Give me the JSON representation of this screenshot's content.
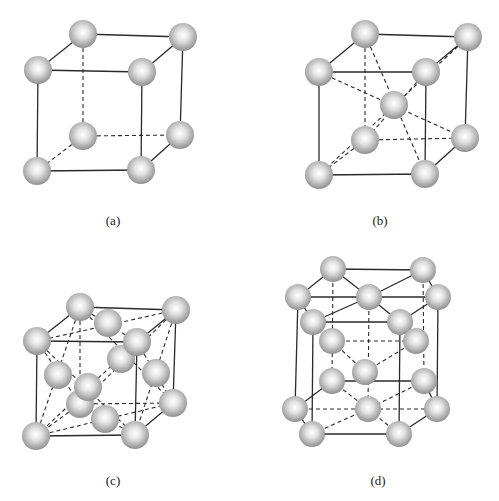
{
  "figure": {
    "sphere_color_center": "#ffffff",
    "sphere_color_edge": "#8a8a8a",
    "line_color": "#2a2a2a",
    "panels": [
      {
        "id": "a",
        "label": "(a)",
        "label_pos": [
          113,
          213
        ],
        "radius": 14,
        "atoms": [
          [
            83,
            136
          ],
          [
            180,
            135
          ],
          [
            83,
            34
          ],
          [
            183,
            37
          ],
          [
            38,
            70
          ],
          [
            142,
            72
          ],
          [
            37,
            171
          ],
          [
            141,
            170
          ]
        ],
        "edges": [
          [
            [
              83,
              34
            ],
            [
              183,
              37
            ],
            "solid"
          ],
          [
            [
              38,
              70
            ],
            [
              142,
              72
            ],
            "solid"
          ],
          [
            [
              83,
              34
            ],
            [
              38,
              70
            ],
            "solid"
          ],
          [
            [
              183,
              37
            ],
            [
              142,
              72
            ],
            "solid"
          ],
          [
            [
              38,
              70
            ],
            [
              37,
              171
            ],
            "solid"
          ],
          [
            [
              142,
              72
            ],
            [
              141,
              170
            ],
            "solid"
          ],
          [
            [
              183,
              37
            ],
            [
              180,
              135
            ],
            "solid"
          ],
          [
            [
              37,
              171
            ],
            [
              141,
              170
            ],
            "solid"
          ],
          [
            [
              180,
              135
            ],
            [
              141,
              170
            ],
            "solid"
          ],
          [
            [
              83,
              34
            ],
            [
              83,
              136
            ],
            "dash"
          ],
          [
            [
              83,
              136
            ],
            [
              180,
              135
            ],
            "dash"
          ],
          [
            [
              83,
              136
            ],
            [
              37,
              171
            ],
            "dash"
          ]
        ]
      },
      {
        "id": "b",
        "label": "(b)",
        "label_pos": [
          380,
          213
        ],
        "radius": 14,
        "atoms": [
          [
            365,
            140
          ],
          [
            465,
            138
          ],
          [
            365,
            34
          ],
          [
            468,
            37
          ],
          [
            319,
            72
          ],
          [
            426,
            72
          ],
          [
            394,
            105
          ],
          [
            319,
            175
          ],
          [
            425,
            174
          ]
        ],
        "edges": [
          [
            [
              365,
              34
            ],
            [
              468,
              37
            ],
            "solid"
          ],
          [
            [
              319,
              72
            ],
            [
              426,
              72
            ],
            "solid"
          ],
          [
            [
              365,
              34
            ],
            [
              319,
              72
            ],
            "solid"
          ],
          [
            [
              468,
              37
            ],
            [
              426,
              72
            ],
            "solid"
          ],
          [
            [
              319,
              72
            ],
            [
              319,
              175
            ],
            "solid"
          ],
          [
            [
              426,
              72
            ],
            [
              425,
              174
            ],
            "solid"
          ],
          [
            [
              468,
              37
            ],
            [
              465,
              138
            ],
            "solid"
          ],
          [
            [
              319,
              175
            ],
            [
              425,
              174
            ],
            "solid"
          ],
          [
            [
              465,
              138
            ],
            [
              425,
              174
            ],
            "solid"
          ],
          [
            [
              365,
              34
            ],
            [
              365,
              140
            ],
            "dash"
          ],
          [
            [
              365,
              140
            ],
            [
              465,
              138
            ],
            "dash"
          ],
          [
            [
              365,
              140
            ],
            [
              319,
              175
            ],
            "dash"
          ],
          [
            [
              365,
              34
            ],
            [
              425,
              174
            ],
            "dash"
          ],
          [
            [
              319,
              72
            ],
            [
              465,
              138
            ],
            "dash"
          ],
          [
            [
              468,
              37
            ],
            [
              319,
              175
            ],
            "dash"
          ],
          [
            [
              426,
              72
            ],
            [
              365,
              140
            ],
            "dash"
          ]
        ]
      },
      {
        "id": "c",
        "label": "(c)",
        "label_pos": [
          113,
          473
        ],
        "radius": 14,
        "atoms": [
          [
            173,
            403
          ],
          [
            80,
            307
          ],
          [
            176,
            310
          ],
          [
            121,
            359
          ],
          [
            37,
            341
          ],
          [
            137,
            342
          ],
          [
            108,
            323
          ],
          [
            156,
            373
          ],
          [
            58,
            375
          ],
          [
            80,
            404
          ],
          [
            36,
            436
          ],
          [
            135,
            435
          ],
          [
            105,
            419
          ],
          [
            88,
            387
          ]
        ],
        "edges": [
          [
            [
              80,
              307
            ],
            [
              176,
              310
            ],
            "solid"
          ],
          [
            [
              37,
              341
            ],
            [
              137,
              342
            ],
            "solid"
          ],
          [
            [
              80,
              307
            ],
            [
              37,
              341
            ],
            "solid"
          ],
          [
            [
              176,
              310
            ],
            [
              137,
              342
            ],
            "solid"
          ],
          [
            [
              37,
              341
            ],
            [
              36,
              436
            ],
            "solid"
          ],
          [
            [
              137,
              342
            ],
            [
              135,
              435
            ],
            "solid"
          ],
          [
            [
              176,
              310
            ],
            [
              173,
              403
            ],
            "solid"
          ],
          [
            [
              36,
              436
            ],
            [
              135,
              435
            ],
            "solid"
          ],
          [
            [
              173,
              403
            ],
            [
              135,
              435
            ],
            "solid"
          ],
          [
            [
              80,
              307
            ],
            [
              80,
              404
            ],
            "dash"
          ],
          [
            [
              80,
              404
            ],
            [
              173,
              403
            ],
            "dash"
          ],
          [
            [
              80,
              404
            ],
            [
              36,
              436
            ],
            "dash"
          ],
          [
            [
              80,
              307
            ],
            [
              137,
              342
            ],
            "dash"
          ],
          [
            [
              176,
              310
            ],
            [
              37,
              341
            ],
            "dash"
          ],
          [
            [
              80,
              307
            ],
            [
              36,
              436
            ],
            "dash"
          ],
          [
            [
              37,
              341
            ],
            [
              80,
              404
            ],
            "dash"
          ],
          [
            [
              176,
              310
            ],
            [
              135,
              435
            ],
            "dash"
          ],
          [
            [
              137,
              342
            ],
            [
              173,
              403
            ],
            "dash"
          ],
          [
            [
              37,
              341
            ],
            [
              135,
              435
            ],
            "dash"
          ],
          [
            [
              137,
              342
            ],
            [
              36,
              436
            ],
            "dash"
          ],
          [
            [
              36,
              436
            ],
            [
              173,
              403
            ],
            "dash"
          ],
          [
            [
              135,
              435
            ],
            [
              80,
              404
            ],
            "dash"
          ],
          [
            [
              80,
              307
            ],
            [
              173,
              403
            ],
            "dash"
          ],
          [
            [
              176,
              310
            ],
            [
              80,
              404
            ],
            "dash"
          ]
        ]
      },
      {
        "id": "d",
        "label": "(d)",
        "label_pos": [
          378,
          473
        ],
        "radius": 13,
        "atoms": [
          [
            333,
            269
          ],
          [
            423,
            270
          ],
          [
            298,
            297
          ],
          [
            369,
            297
          ],
          [
            438,
            297
          ],
          [
            313,
            322
          ],
          [
            400,
            322
          ],
          [
            332,
            341
          ],
          [
            416,
            341
          ],
          [
            365,
            372
          ],
          [
            332,
            381
          ],
          [
            424,
            381
          ],
          [
            295,
            409
          ],
          [
            368,
            409
          ],
          [
            437,
            409
          ],
          [
            312,
            434
          ],
          [
            399,
            434
          ]
        ],
        "edges": [
          [
            [
              333,
              269
            ],
            [
              423,
              270
            ],
            "solid"
          ],
          [
            [
              333,
              269
            ],
            [
              298,
              297
            ],
            "solid"
          ],
          [
            [
              423,
              270
            ],
            [
              438,
              297
            ],
            "solid"
          ],
          [
            [
              298,
              297
            ],
            [
              313,
              322
            ],
            "solid"
          ],
          [
            [
              438,
              297
            ],
            [
              400,
              322
            ],
            "solid"
          ],
          [
            [
              313,
              322
            ],
            [
              400,
              322
            ],
            "solid"
          ],
          [
            [
              298,
              297
            ],
            [
              438,
              297
            ],
            "solid"
          ],
          [
            [
              333,
              269
            ],
            [
              369,
              297
            ],
            "solid"
          ],
          [
            [
              423,
              270
            ],
            [
              369,
              297
            ],
            "solid"
          ],
          [
            [
              313,
              322
            ],
            [
              369,
              297
            ],
            "solid"
          ],
          [
            [
              400,
              322
            ],
            [
              369,
              297
            ],
            "solid"
          ],
          [
            [
              298,
              297
            ],
            [
              295,
              409
            ],
            "solid"
          ],
          [
            [
              313,
              322
            ],
            [
              312,
              434
            ],
            "solid"
          ],
          [
            [
              400,
              322
            ],
            [
              399,
              434
            ],
            "solid"
          ],
          [
            [
              438,
              297
            ],
            [
              437,
              409
            ],
            "solid"
          ],
          [
            [
              295,
              409
            ],
            [
              312,
              434
            ],
            "solid"
          ],
          [
            [
              312,
              434
            ],
            [
              399,
              434
            ],
            "solid"
          ],
          [
            [
              399,
              434
            ],
            [
              437,
              409
            ],
            "solid"
          ],
          [
            [
              424,
              381
            ],
            [
              437,
              409
            ],
            "solid"
          ],
          [
            [
              332,
              381
            ],
            [
              295,
              409
            ],
            "solid"
          ],
          [
            [
              332,
              381
            ],
            [
              424,
              381
            ],
            "solid"
          ],
          [
            [
              333,
              269
            ],
            [
              332,
              381
            ],
            "dash"
          ],
          [
            [
              423,
              270
            ],
            [
              424,
              381
            ],
            "dash"
          ],
          [
            [
              369,
              297
            ],
            [
              368,
              409
            ],
            "dash"
          ],
          [
            [
              332,
              341
            ],
            [
              416,
              341
            ],
            "dash"
          ],
          [
            [
              332,
              341
            ],
            [
              365,
              372
            ],
            "dash"
          ],
          [
            [
              416,
              341
            ],
            [
              365,
              372
            ],
            "dash"
          ],
          [
            [
              295,
              409
            ],
            [
              437,
              409
            ],
            "dash"
          ],
          [
            [
              332,
              381
            ],
            [
              368,
              409
            ],
            "dash"
          ],
          [
            [
              424,
              381
            ],
            [
              368,
              409
            ],
            "dash"
          ],
          [
            [
              312,
              434
            ],
            [
              368,
              409
            ],
            "dash"
          ],
          [
            [
              399,
              434
            ],
            [
              368,
              409
            ],
            "dash"
          ]
        ]
      }
    ]
  }
}
